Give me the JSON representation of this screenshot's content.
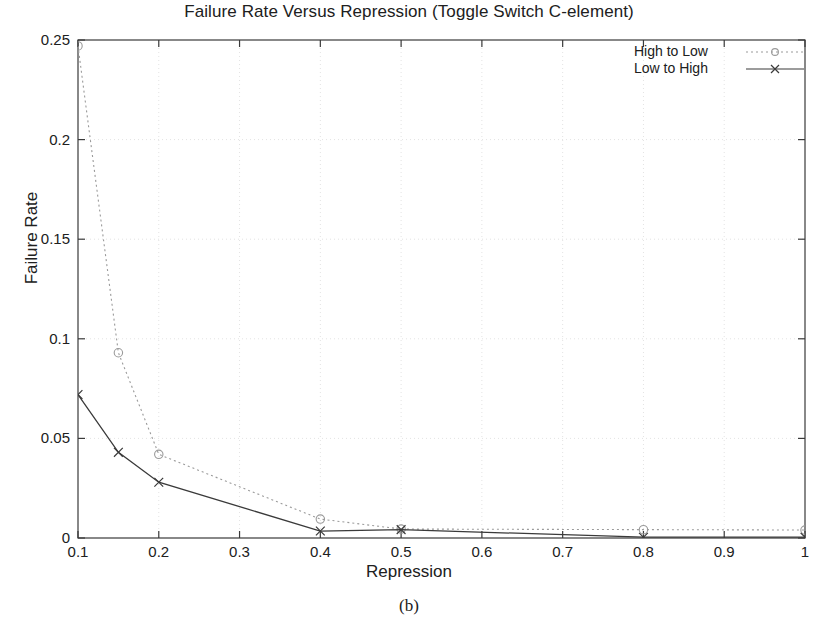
{
  "chart_data": {
    "type": "line",
    "title": "Failure Rate Versus Repression (Toggle Switch C-element)",
    "xlabel": "Repression",
    "ylabel": "Failure Rate",
    "caption": "(b)",
    "xlim": [
      0.1,
      1.0
    ],
    "ylim": [
      0,
      0.25
    ],
    "xticks": [
      "0.1",
      "0.2",
      "0.3",
      "0.4",
      "0.5",
      "0.6",
      "0.7",
      "0.8",
      "0.9",
      "1"
    ],
    "xtick_values": [
      0.1,
      0.2,
      0.3,
      0.4,
      0.5,
      0.6,
      0.7,
      0.8,
      0.9,
      1.0
    ],
    "yticks": [
      "0",
      "0.05",
      "0.1",
      "0.15",
      "0.2",
      "0.25"
    ],
    "ytick_values": [
      0,
      0.05,
      0.1,
      0.15,
      0.2,
      0.25
    ],
    "grid": true,
    "legend_position": "top-right",
    "x": [
      0.1,
      0.15,
      0.2,
      0.4,
      0.5,
      0.8,
      1.0
    ],
    "series": [
      {
        "name": "High to Low",
        "marker": "open-circle",
        "linestyle": "dotted",
        "color": "#9a9a9a",
        "values": [
          0.247,
          0.093,
          0.042,
          0.0095,
          0.0045,
          0.0042,
          0.004
        ]
      },
      {
        "name": "Low to High",
        "marker": "cross",
        "linestyle": "solid",
        "color": "#3a3a3a",
        "values": [
          0.072,
          0.043,
          0.028,
          0.0035,
          0.0042,
          0.0004,
          0.0004
        ]
      }
    ]
  },
  "legend": {
    "items": [
      {
        "label": "High to Low"
      },
      {
        "label": "Low to High"
      }
    ]
  },
  "colors": {
    "axis": "#3a3a3a",
    "grid": "#e3e3e3",
    "series_high_to_low": "#9a9a9a",
    "series_low_to_high": "#3a3a3a",
    "text": "#202020",
    "background": "#ffffff"
  }
}
